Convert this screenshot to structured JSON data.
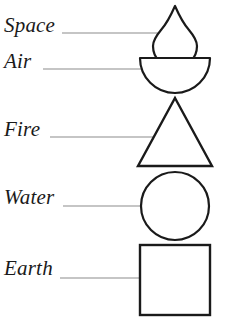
{
  "diagram": {
    "background_color": "#ffffff",
    "stroke_color": "#1a1a1a",
    "leader_line_color": "#8c8c8c",
    "labels": [
      {
        "id": "space",
        "text": "Space",
        "shape": "teardrop-flame-icon"
      },
      {
        "id": "air",
        "text": "Air",
        "shape": "half-disc-icon"
      },
      {
        "id": "fire",
        "text": "Fire",
        "shape": "triangle-icon"
      },
      {
        "id": "water",
        "text": "Water",
        "shape": "circle-icon"
      },
      {
        "id": "earth",
        "text": "Earth",
        "shape": "square-icon"
      }
    ]
  }
}
